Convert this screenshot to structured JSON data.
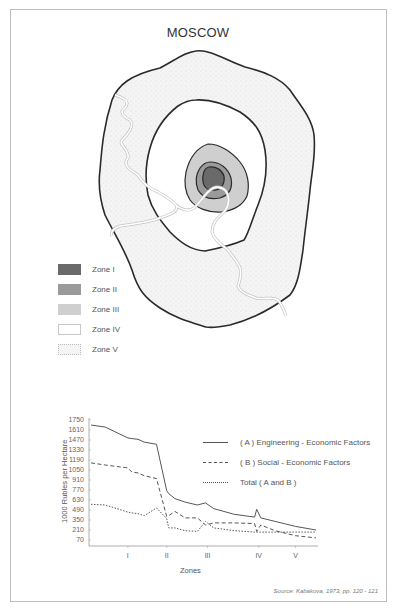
{
  "map": {
    "title": "MOSCOW",
    "legend": [
      {
        "label": "Zone I",
        "color": "#6a6a6a"
      },
      {
        "label": "Zone II",
        "color": "#9a9a9a"
      },
      {
        "label": "Zone III",
        "color": "#cfcfcf"
      },
      {
        "label": "Zone IV",
        "color": "#ffffff"
      },
      {
        "label": "Zone V",
        "color": "#f4f4f4",
        "pattern": "dotted"
      }
    ]
  },
  "chart_data": {
    "type": "line",
    "title": "",
    "xlabel": "Zones",
    "ylabel": "1000 Rubles per Hectare",
    "yticks": [
      1750,
      1610,
      1470,
      1330,
      1190,
      1050,
      910,
      770,
      630,
      490,
      350,
      210,
      70
    ],
    "ylim": [
      0,
      1750
    ],
    "xticks": [
      "I",
      "II",
      "III",
      "IV",
      "V"
    ],
    "grid": false,
    "legend_position": "upper right",
    "x": [
      0,
      0.35,
      0.9,
      1.0,
      1.15,
      1.3,
      1.6,
      1.85,
      1.9,
      2.05,
      2.3,
      2.6,
      2.8,
      3.0,
      3.5,
      4.0,
      4.05,
      4.15,
      4.5,
      5.0,
      5.5
    ],
    "series": [
      {
        "name": "( A ) Engineering - Economic Factors",
        "style": "solid",
        "values": [
          1680,
          1650,
          1500,
          1490,
          1480,
          1440,
          1410,
          760,
          720,
          650,
          600,
          560,
          590,
          510,
          430,
          390,
          500,
          380,
          330,
          260,
          210
        ]
      },
      {
        "name": "( B ) Social - Economic Factors",
        "style": "dashed",
        "values": [
          1150,
          1120,
          1080,
          1020,
          1010,
          970,
          930,
          400,
          410,
          470,
          380,
          380,
          280,
          310,
          310,
          300,
          190,
          280,
          200,
          130,
          100
        ]
      },
      {
        "name": "Total ( A and B )",
        "style": "dotted",
        "values": [
          570,
          560,
          460,
          450,
          440,
          410,
          520,
          370,
          240,
          240,
          200,
          190,
          330,
          240,
          200,
          180,
          180,
          180,
          180,
          180,
          180
        ]
      }
    ]
  },
  "chart_legend": [
    {
      "label": "( A ) Engineering - Economic Factors",
      "style": "solid"
    },
    {
      "label": "( B ) Social - Economic Factors",
      "style": "dashed"
    },
    {
      "label": "Total ( A and B )",
      "style": "dotted"
    }
  ],
  "source": "Source: Kabakova, 1973, pp. 120 - 121"
}
